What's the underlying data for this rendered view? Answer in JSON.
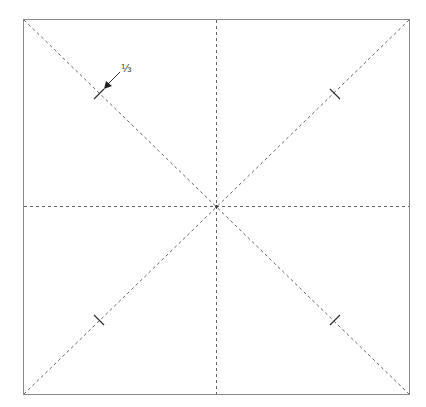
{
  "diagram": {
    "square": {
      "x": 23,
      "y": 19,
      "size": 386,
      "stroke": "#8a8a8a"
    },
    "crease_color": "#555555",
    "creases": [
      {
        "name": "diagonal-tl-br",
        "type": "valley-dashed"
      },
      {
        "name": "diagonal-tr-bl",
        "type": "valley-dashed"
      },
      {
        "name": "vertical-midline",
        "type": "valley-dashed"
      },
      {
        "name": "horizontal-midline",
        "type": "valley-dashed"
      }
    ],
    "tick_marks": [
      {
        "name": "tick-top-left",
        "position": "1/3 along diagonal"
      },
      {
        "name": "tick-top-right",
        "position": "1/3 along diagonal"
      },
      {
        "name": "tick-bottom-left",
        "position": "1/3 along diagonal"
      },
      {
        "name": "tick-bottom-right",
        "position": "1/3 along diagonal"
      }
    ],
    "annotation": {
      "label": "⅓",
      "points_to": "tick-top-left"
    }
  }
}
